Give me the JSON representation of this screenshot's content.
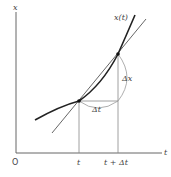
{
  "diagram": {
    "axes": {
      "y_label": "x",
      "x_label": "t",
      "origin_label": "O"
    },
    "curve_label": "x(t)",
    "ticks": {
      "t": "t",
      "t_plus_dt": "t + Δt"
    },
    "increments": {
      "dx": "Δx",
      "dt": "Δt"
    },
    "colors": {
      "curve": "#222222",
      "secant": "#555555",
      "guide": "#888888",
      "axis": "#666666"
    }
  }
}
